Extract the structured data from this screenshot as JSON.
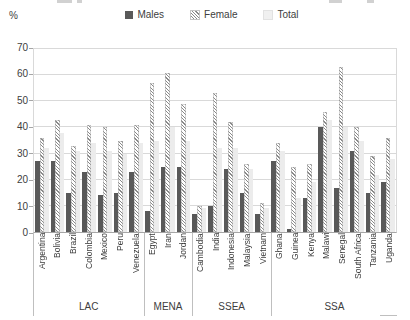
{
  "figure": {
    "percent_label": "%"
  },
  "legend": {
    "items": [
      {
        "label": "Males",
        "key": "males"
      },
      {
        "label": "Female",
        "key": "female"
      },
      {
        "label": "Total",
        "key": "total"
      }
    ]
  },
  "chart_data": {
    "type": "bar",
    "title": "",
    "xlabel": "",
    "ylabel": "%",
    "ylim": [
      0,
      70
    ],
    "yticks": [
      0,
      10,
      20,
      30,
      40,
      50,
      60,
      70
    ],
    "grid": true,
    "legend_position": "top",
    "groups": [
      {
        "label": "LAC",
        "countries": [
          "Argentina",
          "Bolivia",
          "Brazil",
          "Colombia",
          "Mexico",
          "Peru",
          "Venezuela"
        ]
      },
      {
        "label": "MENA",
        "countries": [
          "Egypt",
          "Iran",
          "Jordan"
        ]
      },
      {
        "label": "SSEA",
        "countries": [
          "Cambodia",
          "India",
          "Indonesia",
          "Malaysia",
          "Vietnam"
        ]
      },
      {
        "label": "SSA",
        "countries": [
          "Ghana",
          "Guinea",
          "Kenya",
          "Malawi",
          "Senegal",
          "South Africa",
          "Tanzania",
          "Uganda"
        ]
      }
    ],
    "categories": [
      "Argentina",
      "Bolivia",
      "Brazil",
      "Colombia",
      "Mexico",
      "Peru",
      "Venezuela",
      "Egypt",
      "Iran",
      "Jordan",
      "Cambodia",
      "India",
      "Indonesia",
      "Malaysia",
      "Vietnam",
      "Ghana",
      "Guinea",
      "Kenya",
      "Malawi",
      "Senegal",
      "South Africa",
      "Tanzania",
      "Uganda"
    ],
    "series": [
      {
        "name": "Males",
        "values": [
          27,
          27,
          15,
          23,
          14,
          15,
          23,
          8,
          25,
          25,
          7,
          10,
          24,
          15,
          7,
          27,
          1,
          13,
          40,
          17,
          31,
          15,
          19
        ]
      },
      {
        "name": "Female",
        "values": [
          36,
          43,
          33,
          41,
          40,
          35,
          41,
          57,
          61,
          49,
          10,
          53,
          42,
          26,
          11,
          34,
          25,
          26,
          46,
          63,
          40,
          29,
          36
        ]
      },
      {
        "name": "Total",
        "values": [
          32,
          38,
          31,
          34,
          31,
          30,
          34,
          35,
          40,
          35,
          9,
          32,
          32,
          24,
          9,
          31,
          13,
          19,
          43,
          40,
          35,
          22,
          28
        ]
      }
    ],
    "colors": {
      "males": "#595959",
      "female_hatch": "#8a8a8a",
      "total": "#ececec",
      "gridline": "#d9d9d9",
      "axis": "#a6a6a6"
    }
  }
}
